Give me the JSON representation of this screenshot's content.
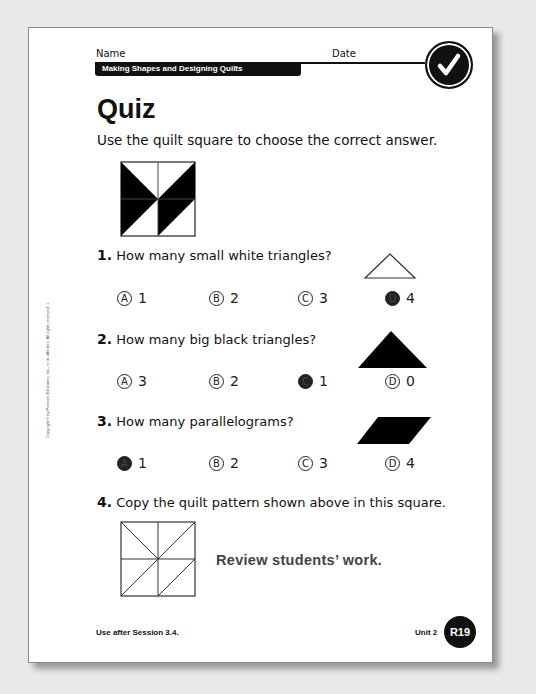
{
  "header": {
    "name_label": "Name",
    "date_label": "Date",
    "unit_title": "Making Shapes and Designing Quilts",
    "check_icon": "checkmark-icon"
  },
  "title": "Quiz",
  "instructions": "Use the quilt square to choose the correct answer.",
  "quilt_square": {
    "grid": "2x2",
    "cells": [
      {
        "position": "top-left",
        "black_triangle": "lower-left (top-left, bottom-right, bottom-left)"
      },
      {
        "position": "top-right",
        "black_triangle": "lower-right (top-right, bottom-right, bottom-left)"
      },
      {
        "position": "bottom-left",
        "black_triangle": "upper-left (top-left, top-right, bottom-left)"
      },
      {
        "position": "bottom-right",
        "black_triangle": "upper-left (top-left, top-right, bottom-left)"
      }
    ]
  },
  "questions": [
    {
      "number": "1.",
      "text": "How many small white triangles?",
      "shape_icon": "white-triangle-icon",
      "answers": [
        {
          "letter": "A",
          "value": "1",
          "selected": false
        },
        {
          "letter": "B",
          "value": "2",
          "selected": false
        },
        {
          "letter": "C",
          "value": "3",
          "selected": false
        },
        {
          "letter": "D",
          "value": "4",
          "selected": true
        }
      ]
    },
    {
      "number": "2.",
      "text": "How many big black triangles?",
      "shape_icon": "black-triangle-icon",
      "answers": [
        {
          "letter": "A",
          "value": "3",
          "selected": false
        },
        {
          "letter": "B",
          "value": "2",
          "selected": false
        },
        {
          "letter": "C",
          "value": "1",
          "selected": true
        },
        {
          "letter": "D",
          "value": "0",
          "selected": false
        }
      ]
    },
    {
      "number": "3.",
      "text": "How many parallelograms?",
      "shape_icon": "black-parallelogram-icon",
      "answers": [
        {
          "letter": "A",
          "value": "1",
          "selected": true
        },
        {
          "letter": "B",
          "value": "2",
          "selected": false
        },
        {
          "letter": "C",
          "value": "3",
          "selected": false
        },
        {
          "letter": "D",
          "value": "4",
          "selected": false
        }
      ]
    },
    {
      "number": "4.",
      "text": "Copy the quilt pattern shown above in this square.",
      "review_note": "Review students’ work."
    }
  ],
  "footer": {
    "session_note": "Use after Session 3.4.",
    "unit": "Unit 2",
    "page_badge": "R19"
  },
  "copyright": "Copyright © by Pearson Education, Inc., or its affiliates. All rights reserved. 1"
}
